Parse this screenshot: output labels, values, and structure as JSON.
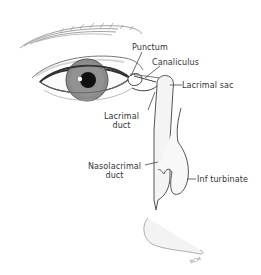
{
  "figure": {
    "labels": {
      "punctum": "Punctum",
      "canaliculus": "Canaliculus",
      "lacrimal_sac": "Lacrimal sac",
      "lacrimal_duct_line1": "Lacrimal",
      "lacrimal_duct_line2": "duct",
      "nasolacrimal_duct_line1": "Nasolacrimal",
      "nasolacrimal_duct_line2": "duct",
      "inf_turbinate": "Inf turbinate"
    },
    "signature": "RCM"
  },
  "colors": {
    "background": "#ffffff",
    "line": "#555555",
    "iris": "#8a8a8a",
    "pupil": "#111111",
    "shading": "#e6e6e6"
  }
}
